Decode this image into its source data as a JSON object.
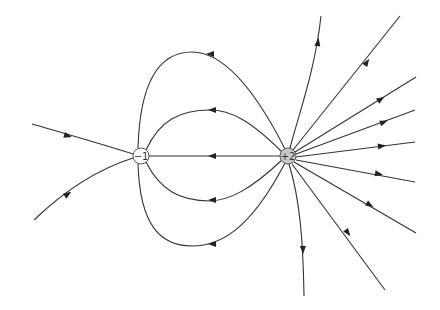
{
  "diagram": {
    "charges": [
      {
        "id": "neg",
        "label": "−1",
        "x": 141,
        "y": 156,
        "r": 8,
        "fill": "#ffffff",
        "stroke": "#555555"
      },
      {
        "id": "pos",
        "label": "+2",
        "x": 288,
        "y": 156,
        "r": 8,
        "fill": "#c8c8c8",
        "stroke": "#555555"
      }
    ],
    "colors": {
      "line": "#333333",
      "arrow": "#222222",
      "background": "#ffffff"
    },
    "field_lines": {
      "connecting": [
        {
          "name": "top-loop",
          "d": "M 285 149 C 250 80, 220 52, 192 52 C 160 52, 140 80, 138 148",
          "arrow": {
            "x": 210,
            "y": 54,
            "angle": 180
          }
        },
        {
          "name": "upper-loop",
          "d": "M 282 152 C 250 120, 230 110, 210 110 C 180 110, 160 120, 146 150",
          "arrow": {
            "x": 212,
            "y": 110,
            "angle": 180
          }
        },
        {
          "name": "middle-line",
          "d": "M 280 156 L 149 156",
          "arrow": {
            "x": 212,
            "y": 156,
            "angle": 180
          }
        },
        {
          "name": "lower-loop",
          "d": "M 282 160 C 250 190, 230 200, 210 201 C 180 201, 160 190, 146 162",
          "arrow": {
            "x": 212,
            "y": 200,
            "angle": 180
          }
        },
        {
          "name": "bottom-loop",
          "d": "M 285 163 C 250 230, 220 246, 192 246 C 160 246, 140 225, 138 164",
          "arrow": {
            "x": 212,
            "y": 244,
            "angle": 180
          }
        }
      ],
      "incoming": [
        {
          "name": "incoming-upper",
          "d": "M 32 124 C 70 135, 105 145, 133 154",
          "arrow": {
            "x": 68,
            "y": 136,
            "angle": 16
          }
        },
        {
          "name": "incoming-lower",
          "d": "M 34 220 C 60 195, 95 170, 133 158",
          "arrow": {
            "x": 68,
            "y": 194,
            "angle": -35
          }
        }
      ],
      "outgoing": [
        {
          "name": "outgoing-up-steep",
          "d": "M 290 148 C 300 110, 315 70, 321 16",
          "arrow": {
            "x": 318,
            "y": 42,
            "angle": -80
          }
        },
        {
          "name": "outgoing-up",
          "d": "M 293 150 L 400 16",
          "arrow": {
            "x": 367,
            "y": 62,
            "angle": -56
          }
        },
        {
          "name": "outgoing-upper-right",
          "d": "M 295 152 L 416 77",
          "arrow": {
            "x": 381,
            "y": 99,
            "angle": -32
          }
        },
        {
          "name": "outgoing-right-high",
          "d": "M 296 154 L 415 110",
          "arrow": {
            "x": 384,
            "y": 122,
            "angle": -21
          }
        },
        {
          "name": "outgoing-right",
          "d": "M 296 157 L 415 142",
          "arrow": {
            "x": 382,
            "y": 146,
            "angle": -7
          }
        },
        {
          "name": "outgoing-right-low",
          "d": "M 296 160 L 415 182",
          "arrow": {
            "x": 379,
            "y": 174,
            "angle": 10
          }
        },
        {
          "name": "outgoing-lower-right",
          "d": "M 294 162 L 416 233",
          "arrow": {
            "x": 370,
            "y": 205,
            "angle": 30
          }
        },
        {
          "name": "outgoing-down",
          "d": "M 292 164 L 385 290",
          "arrow": {
            "x": 348,
            "y": 233,
            "angle": 53
          }
        },
        {
          "name": "outgoing-down-steep",
          "d": "M 289 164 C 300 200, 303 240, 304 296",
          "arrow": {
            "x": 303,
            "y": 250,
            "angle": 88
          }
        }
      ]
    }
  }
}
